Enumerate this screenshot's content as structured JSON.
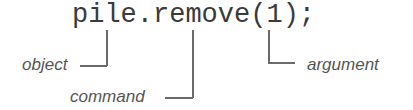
{
  "diagram": {
    "code": "pile.remove(1);",
    "annotations": [
      {
        "label": "object",
        "points_to": "pile"
      },
      {
        "label": "command",
        "points_to": "remove"
      },
      {
        "label": "argument",
        "points_to": "1"
      }
    ]
  }
}
